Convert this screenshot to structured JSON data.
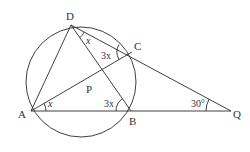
{
  "diagram": {
    "points": {
      "A": {
        "label": "A",
        "x": 31,
        "y": 111
      },
      "B": {
        "label": "B",
        "x": 131,
        "y": 111
      },
      "C": {
        "label": "C",
        "x": 132,
        "y": 52
      },
      "D": {
        "label": "D",
        "x": 71,
        "y": 25
      },
      "P": {
        "label": "P",
        "x": 95,
        "y": 89
      },
      "Q": {
        "label": "Q",
        "x": 231,
        "y": 111
      }
    },
    "circle": {
      "cx": 81,
      "cy": 82,
      "r": 55
    },
    "segments": [
      "AD",
      "DC",
      "DB",
      "AC",
      "AQ",
      "CQ"
    ],
    "angle_labels": {
      "angle_ADC_part": "x",
      "angle_DCA": "3x",
      "angle_CAB": "x",
      "angle_ABD": "3x",
      "angle_Q": "30°"
    },
    "colors": {
      "stroke": "#2a2a2a",
      "text": "#333333",
      "background": "#ffffff"
    }
  }
}
